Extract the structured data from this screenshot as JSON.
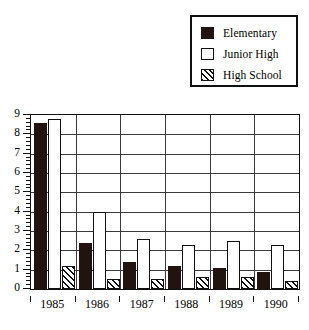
{
  "legend": {
    "position": "top-right",
    "entries": [
      {
        "label": "Elementary",
        "swatch": "solid-black-square",
        "style": "solid"
      },
      {
        "label": "Junior High",
        "swatch": "open-white-square",
        "style": "open"
      },
      {
        "label": "High School",
        "swatch": "hatched-square",
        "style": "hatch"
      }
    ]
  },
  "chart_data": {
    "type": "bar",
    "title": "",
    "subtitle": "",
    "xlabel": "",
    "ylabel": "",
    "categories": [
      "1985",
      "1986",
      "1987",
      "1988",
      "1989",
      "1990"
    ],
    "series": [
      {
        "name": "Elementary",
        "values": [
          8.6,
          2.4,
          1.4,
          1.2,
          1.1,
          0.9
        ]
      },
      {
        "name": "Junior High",
        "values": [
          8.8,
          4.0,
          2.6,
          2.3,
          2.5,
          2.3
        ]
      },
      {
        "name": "High School",
        "values": [
          1.2,
          0.5,
          0.5,
          0.6,
          0.6,
          0.4
        ]
      }
    ],
    "ylim": [
      0,
      9
    ],
    "ytick_labels": [
      "0",
      "1",
      "2",
      "3",
      "4",
      "5",
      "6",
      "7",
      "8",
      "9"
    ],
    "ytick_values": [
      0,
      1,
      2,
      3,
      4,
      5,
      6,
      7,
      8,
      9
    ],
    "yminor_step": 0.2,
    "grid": {
      "horizontal": true,
      "vertical": true
    },
    "legend_position": "top-right",
    "colors": {
      "elementary": "#211310",
      "junior_high": "#ffffff",
      "high_school": "#ffffff",
      "outline": "#111111",
      "grid": "#3a3a3a",
      "background": "#ffffff"
    }
  }
}
